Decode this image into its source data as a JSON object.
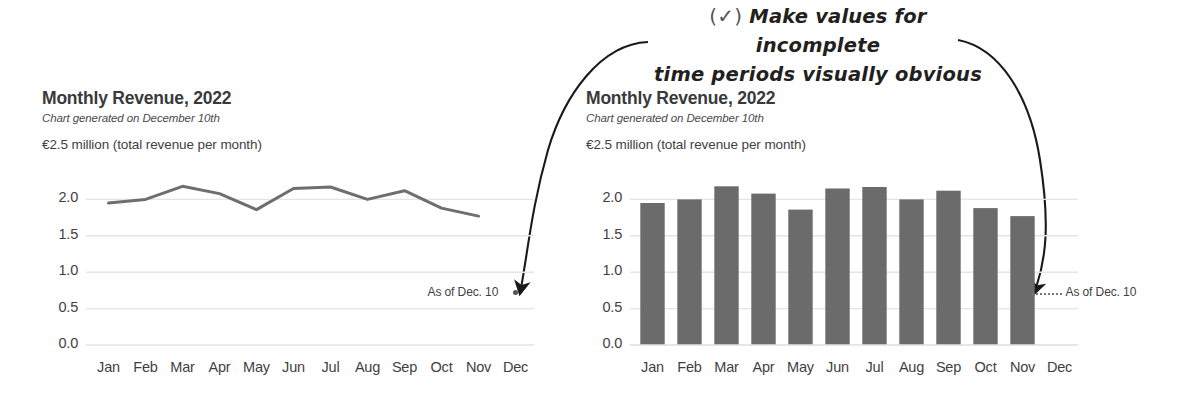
{
  "annotation": {
    "check_glyph": "(✓)",
    "line1": "Make values for incomplete",
    "line2": "time periods visually obvious",
    "arrow_left_name": "curved-arrow-to-line-chart",
    "arrow_right_name": "curved-arrow-to-bar-chart"
  },
  "charts": [
    {
      "id": "line-chart",
      "title": "Monthly Revenue, 2022",
      "subtitle": "Chart generated on December 10th",
      "axis_note": "€2.5 million (total revenue per month)",
      "asof_label": "As of Dec. 10",
      "chart_data": {
        "type": "line",
        "title": "Monthly Revenue, 2022",
        "subtitle": "Chart generated on December 10th",
        "xlabel": "",
        "ylabel": "€ millions (total revenue per month)",
        "ylim": [
          0.0,
          2.5
        ],
        "yticks": [
          "0.0",
          "0.5",
          "1.0",
          "1.5",
          "2.0"
        ],
        "ytick_values": [
          0.0,
          0.5,
          1.0,
          1.5,
          2.0
        ],
        "grid": true,
        "legend": "none",
        "categories": [
          "Jan",
          "Feb",
          "Mar",
          "Apr",
          "May",
          "Jun",
          "Jul",
          "Aug",
          "Sep",
          "Oct",
          "Nov",
          "Dec"
        ],
        "values": [
          1.95,
          2.0,
          2.18,
          2.08,
          1.86,
          2.15,
          2.17,
          2.0,
          2.12,
          1.88,
          1.77,
          null
        ],
        "annotations": [
          "As of Dec. 10"
        ],
        "line_color": "#6e6e6e"
      }
    },
    {
      "id": "bar-chart",
      "title": "Monthly Revenue, 2022",
      "subtitle": "Chart generated on December 10th",
      "axis_note": "€2.5 million (total revenue per month)",
      "asof_label": "As of Dec. 10",
      "chart_data": {
        "type": "bar",
        "title": "Monthly Revenue, 2022",
        "subtitle": "Chart generated on December 10th",
        "xlabel": "",
        "ylabel": "€ millions (total revenue per month)",
        "ylim": [
          0.0,
          2.5
        ],
        "yticks": [
          "0.0",
          "0.5",
          "1.0",
          "1.5",
          "2.0"
        ],
        "ytick_values": [
          0.0,
          0.5,
          1.0,
          1.5,
          2.0
        ],
        "grid": true,
        "legend": "none",
        "categories": [
          "Jan",
          "Feb",
          "Mar",
          "Apr",
          "May",
          "Jun",
          "Jul",
          "Aug",
          "Sep",
          "Oct",
          "Nov",
          "Dec"
        ],
        "values": [
          1.95,
          2.0,
          2.18,
          2.08,
          1.86,
          2.15,
          2.17,
          2.0,
          2.12,
          1.88,
          1.77,
          null
        ],
        "annotations": [
          "As of Dec. 10"
        ],
        "bar_color": "#6b6b6b"
      }
    }
  ],
  "colors": {
    "bar": "#6b6b6b",
    "line": "#6e6e6e",
    "grid": "#e4e4e4",
    "text": "#3f3f3f",
    "ink": "#231f20"
  }
}
